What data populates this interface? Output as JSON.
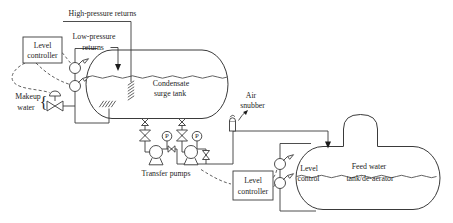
{
  "colors": {
    "line": "#3a3a3a",
    "text": "#1c1c1c",
    "pump_fill": "#b9b9b9",
    "background": "#ffffff"
  },
  "components": {
    "high_pressure_returns": {
      "label": "High-pressure returns"
    },
    "low_pressure_returns": {
      "lines": [
        "Low-pressure",
        "returns"
      ]
    },
    "condensate_level_controller": {
      "lines": [
        "Level",
        "controller"
      ]
    },
    "makeup_water": {
      "lines": [
        "Makeup",
        "water"
      ],
      "brace": "{"
    },
    "condensate_surge_tank": {
      "lines": [
        "Condensate",
        "surge tank"
      ]
    },
    "air_snubber": {
      "lines": [
        "Air",
        "snubber"
      ]
    },
    "transfer_pumps": {
      "label": "Transfer pumps",
      "pressure_gauge_label": "P"
    },
    "feed_level_controller": {
      "lines": [
        "Level",
        "controller"
      ]
    },
    "feed_level_control": {
      "lines": [
        "Level",
        "control"
      ]
    },
    "feed_water_tank": {
      "lines": [
        "Feed water",
        "tank/de-aerator"
      ]
    }
  }
}
